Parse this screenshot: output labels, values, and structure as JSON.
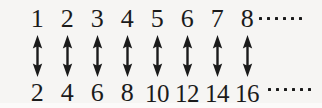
{
  "figure": {
    "background_color": "#f6f5f3",
    "ink_color": "#1b1b1b",
    "top_row": {
      "label": "natural numbers",
      "values": [
        "1",
        "2",
        "3",
        "4",
        "5",
        "6",
        "7",
        "8"
      ],
      "continues": true,
      "ellipsis_dot_count": 6
    },
    "bottom_row": {
      "label": "even numbers",
      "values": [
        "2",
        "4",
        "6",
        "8",
        "10",
        "12",
        "14",
        "16"
      ],
      "continues": true,
      "ellipsis_dot_count": 6
    },
    "connectors": {
      "icon": "double-headed-vertical-arrow",
      "glyph": "↕",
      "count": 8
    }
  }
}
